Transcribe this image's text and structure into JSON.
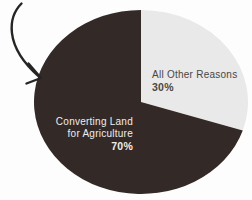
{
  "page": {
    "background_color": "#fdfdfd"
  },
  "chart_data": {
    "type": "pie",
    "title": "",
    "start_angle": "top",
    "direction": "clockwise",
    "labels_position": "inside-slices",
    "slices": [
      {
        "label": "All Other Reasons",
        "label_lines": [
          "All Other Reasons"
        ],
        "pct_label": "30%",
        "value": 30,
        "color": "#e8e9e8",
        "label_color": "#4a4645"
      },
      {
        "label": "Converting Land for Agriculture",
        "label_lines": [
          "Converting Land",
          "for Agriculture"
        ],
        "pct_label": "70%",
        "value": 70,
        "color": "#332926",
        "label_color": "#f0eeec"
      }
    ]
  },
  "annotations": {
    "arrow": {
      "color": "#262524"
    }
  }
}
